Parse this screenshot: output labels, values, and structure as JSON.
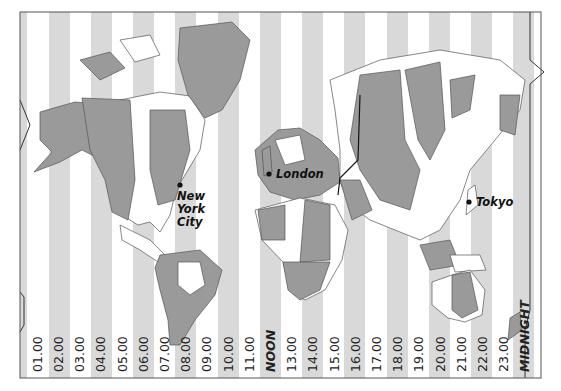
{
  "map": {
    "title": "World Time Zones",
    "colors": {
      "stripe_grey": "#d9d9d9",
      "stripe_white": "#ffffff",
      "land_dark": "#9a9a9a",
      "land_light": "#ffffff",
      "land_outline": "#555555",
      "frame": "#555555",
      "date_line": "#333333"
    },
    "zone_labels": [
      "01.00",
      "02.00",
      "03.00",
      "04.00",
      "05.00",
      "06.00",
      "07.00",
      "08.00",
      "09.00",
      "10.00",
      "11.00",
      "NOON",
      "13.00",
      "14.00",
      "15.00",
      "16.00",
      "17.00",
      "18.00",
      "19.00",
      "20.00",
      "21.00",
      "22.00",
      "23.00",
      "MIDNIGHT"
    ],
    "cities": [
      {
        "name": "New York City",
        "lines": [
          "New",
          "York",
          "City"
        ]
      },
      {
        "name": "London",
        "lines": [
          "London"
        ]
      },
      {
        "name": "Tokyo",
        "lines": [
          "Tokyo"
        ]
      }
    ]
  }
}
